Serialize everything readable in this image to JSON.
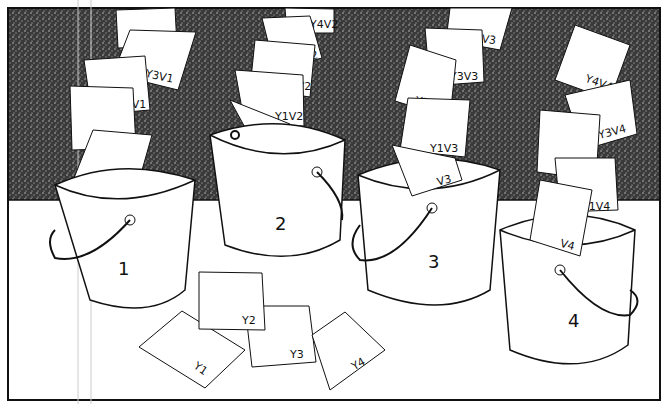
{
  "illustration": {
    "style": "hand-drawn black ink, stippled dark wall, white floor",
    "colors": {
      "ink": "#111111",
      "wall": "#4a4a4a",
      "floor": "#ffffff"
    }
  },
  "buckets": [
    {
      "label": "1",
      "cards": [
        "V1",
        "Y1V1",
        "Y2V1",
        "Y3V1",
        "Y4V1"
      ]
    },
    {
      "label": "2",
      "cards": [
        "V2",
        "Y1V2",
        "Y2V2",
        "Y3V2",
        "Y4V2"
      ]
    },
    {
      "label": "3",
      "cards": [
        "V3",
        "Y1V3",
        "Y2V3",
        "Y3V3",
        "Y4V3"
      ]
    },
    {
      "label": "4",
      "cards": [
        "V4",
        "Y1V4",
        "Y2V4",
        "Y3V4",
        "Y4V4"
      ]
    }
  ],
  "floor_cards": [
    "Y1",
    "Y2",
    "Y3",
    "Y4"
  ]
}
